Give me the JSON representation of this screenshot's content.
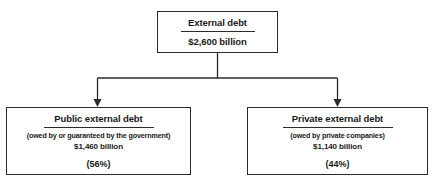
{
  "diagram": {
    "type": "tree",
    "line_color": "#2b2b2b",
    "background_color": "#ffffff",
    "root": {
      "title": "External debt",
      "amount": "$2,600 billion"
    },
    "children": [
      {
        "title": "Public external debt",
        "subtitle": "(owed by or guaranteed by the government)",
        "amount": "$1,460 billion",
        "percent": "(56%)"
      },
      {
        "title": "Private external debt",
        "subtitle": "(owed by private companies)",
        "amount": "$1,140 billion",
        "percent": "(44%)"
      }
    ]
  }
}
